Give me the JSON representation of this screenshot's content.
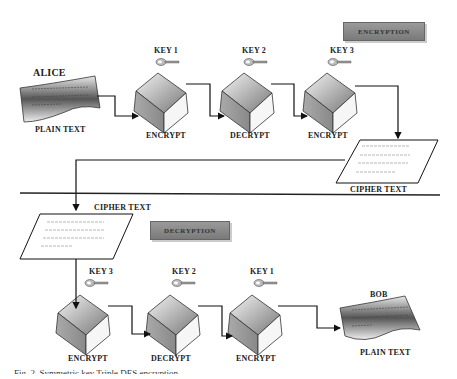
{
  "encryption": {
    "banner": "ENCRYPTION",
    "sender": "ALICE",
    "input_label": "PLAIN TEXT",
    "stages": [
      {
        "key": "KEY 1",
        "op": "ENCRYPT"
      },
      {
        "key": "KEY 2",
        "op": "DECRYPT"
      },
      {
        "key": "KEY 3",
        "op": "ENCRYPT"
      }
    ],
    "output_label": "CIPHER TEXT"
  },
  "decryption": {
    "banner": "DECRYPTION",
    "input_label": "CIPHER TEXT",
    "stages": [
      {
        "key": "KEY 3",
        "op": "ENCRYPT"
      },
      {
        "key": "KEY 2",
        "op": "DECRYPT"
      },
      {
        "key": "KEY 1",
        "op": "ENCRYPT"
      }
    ],
    "receiver": "BOB",
    "output_label": "PLAIN TEXT"
  },
  "caption": "Fig. 2. Symmetric key Triple DES encryption"
}
